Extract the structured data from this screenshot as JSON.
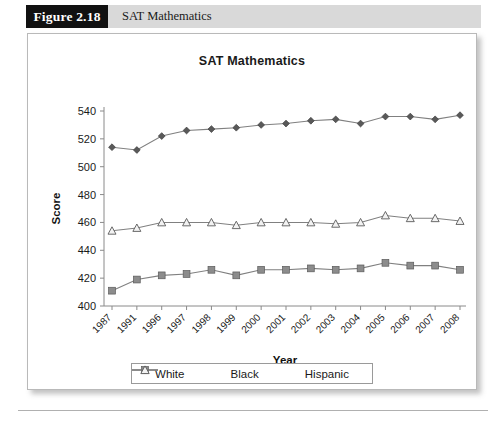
{
  "caption": {
    "figure_tag": "Figure 2.18",
    "title": "SAT Mathematics"
  },
  "chart_data": {
    "type": "line",
    "title": "SAT Mathematics",
    "xlabel": "Year",
    "ylabel": "Score",
    "ylim": [
      400,
      540
    ],
    "ytick_step": 20,
    "yticks": [
      400,
      420,
      440,
      460,
      480,
      500,
      520,
      540
    ],
    "grid": false,
    "legend_position": "bottom",
    "categories": [
      "1987",
      "1991",
      "1996",
      "1997",
      "1998",
      "1999",
      "2000",
      "2001",
      "2002",
      "2003",
      "2004",
      "2005",
      "2006",
      "2007",
      "2008"
    ],
    "series": [
      {
        "name": "White",
        "marker": "filled-diamond",
        "color": "#595959",
        "values": [
          514,
          512,
          522,
          526,
          527,
          528,
          530,
          531,
          533,
          534,
          531,
          536,
          536,
          534,
          537
        ]
      },
      {
        "name": "Black",
        "marker": "filled-square",
        "color": "#8c8c8c",
        "values": [
          411,
          419,
          422,
          423,
          426,
          422,
          426,
          426,
          427,
          426,
          427,
          431,
          429,
          429,
          426
        ]
      },
      {
        "name": "Hispanic",
        "marker": "open-triangle",
        "color": "#f2f2f2",
        "values": [
          454,
          456,
          460,
          460,
          460,
          458,
          460,
          460,
          460,
          459,
          460,
          465,
          463,
          463,
          461
        ]
      }
    ]
  },
  "legend": {
    "items": [
      {
        "label": "White",
        "marker": "filled-diamond"
      },
      {
        "label": "Black",
        "marker": "filled-square"
      },
      {
        "label": "Hispanic",
        "marker": "open-triangle"
      }
    ]
  }
}
